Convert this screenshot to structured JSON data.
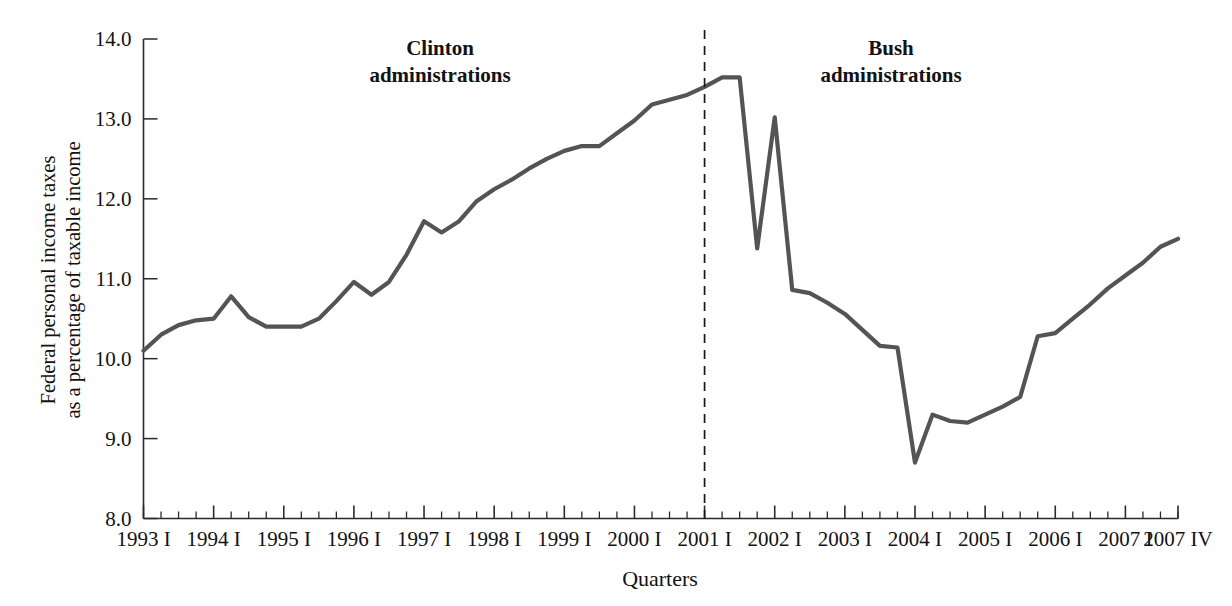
{
  "chart_data": {
    "type": "line",
    "title": "",
    "xlabel": "Quarters",
    "ylabel": "Federal personal income taxes as a percentage of taxable income",
    "ylabel_line1": "Federal personal income taxes",
    "ylabel_line2": "as a percentage of taxable income",
    "ylim": [
      8.0,
      14.0
    ],
    "ytick_labels": [
      "14.0",
      "13.0",
      "12.0",
      "11.0",
      "10.0",
      "9.0",
      "8.0"
    ],
    "ytick_values": [
      14.0,
      13.0,
      12.0,
      11.0,
      10.0,
      9.0,
      8.0
    ],
    "grid": false,
    "legend": false,
    "xtick_labels": [
      "1993 I",
      "1994 I",
      "1995 I",
      "1996 I",
      "1997 I",
      "1998 I",
      "1999 I",
      "2000 I",
      "2001 I",
      "2002 I",
      "2003 I",
      "2004 I",
      "2005 I",
      "2006 I",
      "2007 I",
      "2007 IV"
    ],
    "x_quarters": [
      "1993 I",
      "1993 II",
      "1993 III",
      "1993 IV",
      "1994 I",
      "1994 II",
      "1994 III",
      "1994 IV",
      "1995 I",
      "1995 II",
      "1995 III",
      "1995 IV",
      "1996 I",
      "1996 II",
      "1996 III",
      "1996 IV",
      "1997 I",
      "1997 II",
      "1997 III",
      "1997 IV",
      "1998 I",
      "1998 II",
      "1998 III",
      "1998 IV",
      "1999 I",
      "1999 II",
      "1999 III",
      "1999 IV",
      "2000 I",
      "2000 II",
      "2000 III",
      "2000 IV",
      "2001 I",
      "2001 II",
      "2001 III",
      "2001 IV",
      "2002 I",
      "2002 II",
      "2002 III",
      "2002 IV",
      "2003 I",
      "2003 II",
      "2003 III",
      "2003 IV",
      "2004 I",
      "2004 II",
      "2004 III",
      "2004 IV",
      "2005 I",
      "2005 II",
      "2005 III",
      "2005 IV",
      "2006 I",
      "2006 II",
      "2006 III",
      "2006 IV",
      "2007 I",
      "2007 II",
      "2007 III",
      "2007 IV"
    ],
    "values": [
      10.1,
      10.3,
      10.42,
      10.48,
      10.5,
      10.78,
      10.52,
      10.4,
      10.4,
      10.4,
      10.5,
      10.72,
      10.96,
      10.8,
      10.96,
      11.3,
      11.72,
      11.58,
      11.72,
      11.97,
      12.12,
      12.24,
      12.38,
      12.5,
      12.6,
      12.66,
      12.66,
      12.82,
      12.98,
      13.18,
      13.24,
      13.3,
      13.4,
      13.52,
      13.52,
      11.38,
      13.02,
      10.86,
      10.82,
      10.7,
      10.56,
      10.36,
      10.16,
      10.14,
      8.7,
      9.3,
      9.22,
      9.2,
      9.3,
      9.4,
      9.52,
      10.28,
      10.32,
      10.5,
      10.68,
      10.88,
      11.04,
      11.2,
      11.4,
      11.5
    ],
    "annotations": [
      {
        "id": "clinton",
        "line1": "Clinton",
        "line2": "administrations"
      },
      {
        "id": "bush",
        "line1": "Bush",
        "line2": "administrations"
      }
    ],
    "divider": {
      "at": "2001 I",
      "style": "dashed"
    },
    "series_color": "#545454",
    "axis_color": "#2b2b2b"
  }
}
